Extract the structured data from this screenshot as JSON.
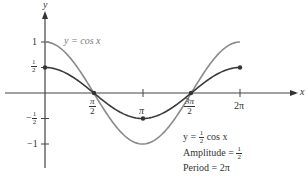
{
  "chart_data": {
    "type": "line",
    "title": "",
    "xlabel": "x",
    "ylabel": "y",
    "x_ticks": [
      "π/2",
      "π",
      "3π/2",
      "2π"
    ],
    "x_tick_values": [
      1.5708,
      3.1416,
      4.7124,
      6.2832
    ],
    "y_ticks": [
      "1",
      "1/2",
      "-1/2",
      "-1"
    ],
    "y_tick_values": [
      1,
      0.5,
      -0.5,
      -1
    ],
    "xlim": [
      0,
      6.2832
    ],
    "ylim": [
      -1,
      1
    ],
    "grid": false,
    "series": [
      {
        "name": "y = cos x",
        "color": "#8a8a8a",
        "function": "cos(x)",
        "x": [
          0,
          1.5708,
          3.1416,
          4.7124,
          6.2832
        ],
        "values": [
          1,
          0,
          -1,
          0,
          1
        ]
      },
      {
        "name": "y = 1/2 cos x",
        "color": "#3a3a3a",
        "function": "0.5*cos(x)",
        "x": [
          0,
          1.5708,
          3.1416,
          4.7124,
          6.2832
        ],
        "values": [
          0.5,
          0,
          -0.5,
          0,
          0.5
        ]
      }
    ],
    "annotations": [
      "y = cos x",
      "y = 1/2 cos x",
      "Amplitude = 1/2",
      "Period = 2π"
    ]
  },
  "labels": {
    "x_axis": "x",
    "y_axis": "y",
    "cos_label": "y = cos x",
    "half_cos_prefix": "y = ",
    "half_cos_suffix": " cos x",
    "amplitude_prefix": "Amplitude = ",
    "period": "Period = 2π",
    "tick_pi_half_num": "π",
    "tick_pi_half_den": "2",
    "tick_pi": "π",
    "tick_3pi_half_num": "3π",
    "tick_3pi_half_den": "2",
    "tick_2pi": "2π",
    "ytick_1": "1",
    "ytick_half_num": "1",
    "ytick_half_den": "2",
    "ytick_neg_half_sign": "−",
    "ytick_neg1": "−1",
    "half_num": "1",
    "half_den": "2"
  }
}
